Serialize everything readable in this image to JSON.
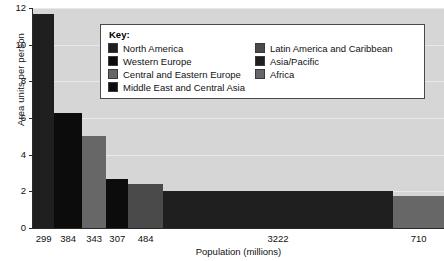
{
  "chart_data": {
    "type": "bar",
    "title": "",
    "xlabel": "Population (millions)",
    "ylabel": "Area units per person",
    "ylim": [
      0,
      12
    ],
    "yticks": [
      12,
      10,
      8,
      6,
      4,
      2,
      0
    ],
    "grid": true,
    "note": "Variable-width bar chart: bar width is proportional to population (millions); bar height is area units per person.",
    "categories": [
      "299",
      "384",
      "343",
      "307",
      "484",
      "3222",
      "710"
    ],
    "values": [
      11.7,
      6.3,
      5.0,
      2.7,
      2.4,
      2.0,
      1.75
    ],
    "widths": [
      299,
      384,
      343,
      307,
      484,
      3222,
      710
    ],
    "series_names": [
      "North America",
      "Western Europe",
      "Central and Eastern Europe",
      "Middle East and Central Asia",
      "Latin America and Caribbean",
      "Asia/Pacific",
      "Africa"
    ],
    "colors": [
      "#1f1f1f",
      "#0c0c0c",
      "#676767",
      "#0c0c0c",
      "#4a4a4a",
      "#1f1f1f",
      "#676767"
    ],
    "plot_background": "#d6d6d6",
    "gridline_color": "#ececec"
  },
  "legend": {
    "title": "Key:",
    "position": "inside-top-center",
    "columns": [
      [
        {
          "label": "North America",
          "color": "#1f1f1f"
        },
        {
          "label": "Western Europe",
          "color": "#0c0c0c"
        },
        {
          "label": "Central and Eastern Europe",
          "color": "#676767"
        },
        {
          "label": "Middle East and Central Asia",
          "color": "#0c0c0c"
        }
      ],
      [
        {
          "label": "Latin America and Caribbean",
          "color": "#4a4a4a"
        },
        {
          "label": "Asia/Pacific",
          "color": "#1f1f1f"
        },
        {
          "label": "Africa",
          "color": "#676767"
        }
      ]
    ]
  }
}
